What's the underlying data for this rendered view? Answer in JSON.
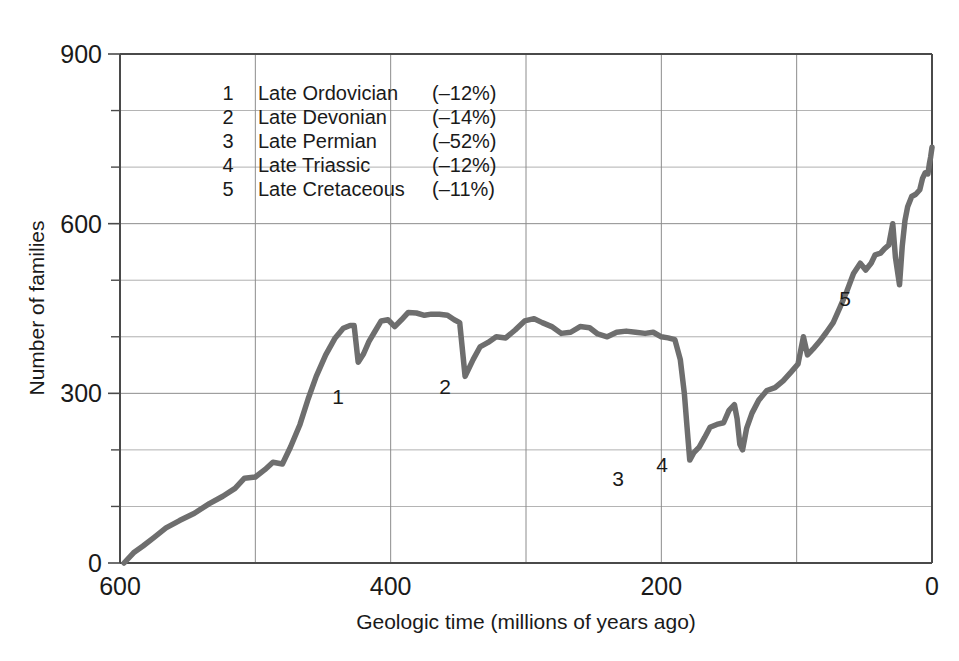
{
  "chart_data": {
    "type": "line",
    "title": "",
    "xlabel": "Geologic time (millions of years ago)",
    "ylabel": "Number of families",
    "xlim": [
      600,
      0
    ],
    "ylim": [
      0,
      900
    ],
    "x_ticks": [
      600,
      400,
      200,
      0
    ],
    "x_tick_labels": [
      "600",
      "400",
      "200",
      "0"
    ],
    "x_gridlines": [
      600,
      500,
      400,
      300,
      200,
      100,
      0
    ],
    "y_ticks": [
      0,
      300,
      600,
      900
    ],
    "y_tick_labels": [
      "0",
      "300",
      "600",
      "900"
    ],
    "y_gridlines": [
      0,
      100,
      200,
      300,
      400,
      500,
      600,
      700,
      800,
      900
    ],
    "y_minor_ticks": [
      100,
      200,
      400,
      500,
      700,
      800
    ],
    "grid": true,
    "legend_position": "upper-left-inside",
    "line_color": "#6e6e6e",
    "axis_color": "#4a4a4a",
    "grid_color": "#8c8c8c",
    "series": [
      {
        "name": "Number of marine animal families",
        "points": [
          [
            597,
            0
          ],
          [
            590,
            18
          ],
          [
            583,
            30
          ],
          [
            575,
            45
          ],
          [
            566,
            62
          ],
          [
            556,
            75
          ],
          [
            545,
            88
          ],
          [
            534,
            105
          ],
          [
            524,
            118
          ],
          [
            515,
            132
          ],
          [
            508,
            150
          ],
          [
            500,
            152
          ],
          [
            493,
            165
          ],
          [
            487,
            178
          ],
          [
            480,
            175
          ],
          [
            474,
            205
          ],
          [
            467,
            245
          ],
          [
            461,
            290
          ],
          [
            455,
            330
          ],
          [
            448,
            368
          ],
          [
            441,
            398
          ],
          [
            435,
            415
          ],
          [
            430,
            420
          ],
          [
            427,
            420
          ],
          [
            424,
            355
          ],
          [
            420,
            370
          ],
          [
            416,
            392
          ],
          [
            412,
            408
          ],
          [
            407,
            428
          ],
          [
            402,
            430
          ],
          [
            397,
            418
          ],
          [
            392,
            430
          ],
          [
            387,
            443
          ],
          [
            381,
            442
          ],
          [
            375,
            438
          ],
          [
            370,
            440
          ],
          [
            364,
            440
          ],
          [
            358,
            438
          ],
          [
            353,
            430
          ],
          [
            349,
            425
          ],
          [
            345,
            330
          ],
          [
            339,
            360
          ],
          [
            334,
            382
          ],
          [
            328,
            390
          ],
          [
            322,
            400
          ],
          [
            315,
            398
          ],
          [
            308,
            412
          ],
          [
            301,
            428
          ],
          [
            294,
            432
          ],
          [
            288,
            425
          ],
          [
            281,
            418
          ],
          [
            274,
            406
          ],
          [
            267,
            408
          ],
          [
            260,
            418
          ],
          [
            253,
            416
          ],
          [
            247,
            405
          ],
          [
            240,
            400
          ],
          [
            233,
            408
          ],
          [
            226,
            410
          ],
          [
            219,
            408
          ],
          [
            212,
            406
          ],
          [
            206,
            408
          ],
          [
            200,
            400
          ],
          [
            195,
            398
          ],
          [
            190,
            395
          ],
          [
            186,
            360
          ],
          [
            183,
            300
          ],
          [
            181,
            240
          ],
          [
            179,
            182
          ],
          [
            176,
            195
          ],
          [
            172,
            205
          ],
          [
            168,
            222
          ],
          [
            164,
            240
          ],
          [
            159,
            245
          ],
          [
            154,
            248
          ],
          [
            150,
            270
          ],
          [
            146,
            280
          ],
          [
            144,
            255
          ],
          [
            142,
            210
          ],
          [
            140,
            200
          ],
          [
            137,
            238
          ],
          [
            133,
            265
          ],
          [
            128,
            288
          ],
          [
            122,
            305
          ],
          [
            116,
            310
          ],
          [
            110,
            322
          ],
          [
            104,
            338
          ],
          [
            99,
            352
          ],
          [
            95,
            400
          ],
          [
            92,
            368
          ],
          [
            88,
            378
          ],
          [
            83,
            392
          ],
          [
            78,
            408
          ],
          [
            73,
            425
          ],
          [
            68,
            452
          ],
          [
            63,
            480
          ],
          [
            58,
            512
          ],
          [
            53,
            530
          ],
          [
            49,
            518
          ],
          [
            45,
            530
          ],
          [
            42,
            545
          ],
          [
            38,
            548
          ],
          [
            35,
            556
          ],
          [
            32,
            562
          ],
          [
            29,
            600
          ],
          [
            27,
            540
          ],
          [
            24,
            492
          ],
          [
            22,
            560
          ],
          [
            20,
            605
          ],
          [
            18,
            630
          ],
          [
            15,
            648
          ],
          [
            12,
            652
          ],
          [
            9,
            660
          ],
          [
            7,
            680
          ],
          [
            5,
            690
          ],
          [
            3,
            688
          ],
          [
            2,
            705
          ],
          [
            1,
            718
          ],
          [
            0,
            735
          ]
        ]
      }
    ],
    "extinction_events": [
      {
        "id": "1",
        "label": "Late Ordovician",
        "magnitude": "(–12%)",
        "x": 434,
        "y": 355,
        "label_x": 338,
        "label_y": 404
      },
      {
        "id": "2",
        "label": "Late Devonian",
        "magnitude": "(–14%)",
        "x": 345,
        "y": 330,
        "label_x": 445,
        "label_y": 394
      },
      {
        "id": "3",
        "label": "Late Permian",
        "magnitude": "(–52%)",
        "x": 179,
        "y": 182,
        "label_x": 618,
        "label_y": 486
      },
      {
        "id": "4",
        "label": "Late Triassic",
        "magnitude": "(–12%)",
        "x": 140,
        "y": 200,
        "label_x": 662,
        "label_y": 472
      },
      {
        "id": "5",
        "label": "Late Cretaceous",
        "magnitude": "(–11%)",
        "x": 24,
        "y": 492,
        "label_x": 845,
        "label_y": 306
      }
    ],
    "legend_entries": [
      {
        "num": "1",
        "name": "Late Ordovician",
        "pct": "(–12%)"
      },
      {
        "num": "2",
        "name": "Late Devonian",
        "pct": "(–14%)"
      },
      {
        "num": "3",
        "name": "Late Permian",
        "pct": "(–52%)"
      },
      {
        "num": "4",
        "name": "Late Triassic",
        "pct": "(–12%)"
      },
      {
        "num": "5",
        "name": "Late Cretaceous",
        "pct": "(–11%)"
      }
    ]
  }
}
